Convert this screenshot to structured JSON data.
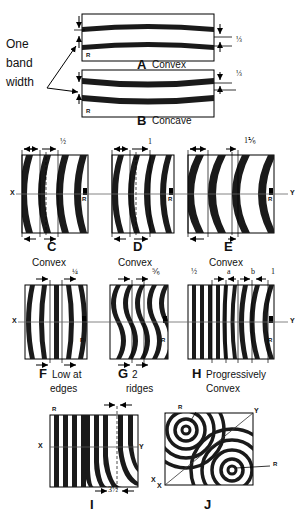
{
  "figure": {
    "annotation_left": {
      "line1": "One",
      "line2": "band",
      "line3": "width"
    },
    "panels": [
      {
        "id": "A",
        "letter": "A",
        "caption": "Convex",
        "dimension": "⅓",
        "corner_mark": "R",
        "style": "horizontal-bands-convex"
      },
      {
        "id": "B",
        "letter": "B",
        "caption": "Concave",
        "dimension": "⅓",
        "corner_mark": "R",
        "style": "horizontal-bands-concave"
      },
      {
        "id": "C",
        "letter": "C",
        "caption": "Convex",
        "dimension": "½",
        "axis_left": "X",
        "corner_mark": "R",
        "style": "vertical-curved-bands"
      },
      {
        "id": "D",
        "letter": "D",
        "caption": "Convex",
        "dimension": "1",
        "corner_mark": "R",
        "style": "vertical-curved-bands"
      },
      {
        "id": "E",
        "letter": "E",
        "caption": "Convex",
        "dimension": "1⅙",
        "axis_right": "Y",
        "corner_mark": "R",
        "style": "vertical-curved-bands"
      },
      {
        "id": "F",
        "letter": "F",
        "caption": "Low at edges",
        "caption_line1": "Low at",
        "caption_line2": "edges",
        "dimension": "¼",
        "axis_left": "X",
        "corner_mark": "R",
        "style": "vertical-bands-low-edges"
      },
      {
        "id": "G",
        "letter": "G",
        "caption": "2 ridges",
        "caption_line1": "2",
        "caption_line2": "ridges",
        "dimension": "⅚",
        "corner_mark": "R",
        "style": "vertical-wavy-bands"
      },
      {
        "id": "H",
        "letter": "H",
        "caption": "Progressively Convex",
        "caption_line1": "Progressively",
        "caption_line2": "Convex",
        "dimensions": [
          "½",
          "a",
          "b",
          "1"
        ],
        "axis_right": "Y",
        "corner_mark": "R",
        "style": "progressive-bands"
      },
      {
        "id": "I",
        "letter": "I",
        "caption": "",
        "dimension": "3½",
        "axis_left": "X",
        "axis_right": "Y",
        "axis_far_right": "X",
        "corner_mark": "R",
        "style": "vertical-bands-curving"
      },
      {
        "id": "J",
        "letter": "J",
        "caption": "",
        "axis_top_right": "Y",
        "axis_bottom_left": "X",
        "corner_mark_top": "R",
        "corner_mark_bottom": "R",
        "style": "concentric-saddle"
      }
    ],
    "colors": {
      "band": "#1a1a1a",
      "outline": "#000000",
      "background": "#ffffff",
      "axis": "#555555"
    }
  }
}
